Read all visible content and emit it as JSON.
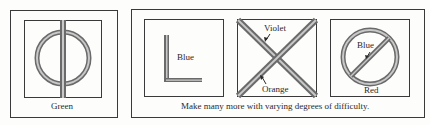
{
  "panels": {
    "left": {
      "label": "Green",
      "figure": "circle-with-vertical-line"
    },
    "right": {
      "caption": "Make many more with varying degrees of difficulty.",
      "figures": [
        {
          "figure": "l-shape",
          "labels": [
            "Blue"
          ]
        },
        {
          "figure": "x-cross",
          "labels": [
            "Violet",
            "Orange"
          ]
        },
        {
          "figure": "circle-with-diagonal",
          "labels": [
            "Blue",
            "Red"
          ]
        }
      ]
    }
  },
  "colors": {
    "line": "#3a3a3a",
    "stripe_dark": "#6a6a6a",
    "stripe_light": "#c8c8c8"
  }
}
